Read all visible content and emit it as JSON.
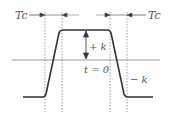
{
  "diagram": {
    "type": "trapezoidal-pulse",
    "colors": {
      "pulse": "#333333",
      "axis": "#999999",
      "dashed": "#888888",
      "arrow": "#444444",
      "text": "#555555"
    },
    "labels": {
      "tc_left": "Tc",
      "tc_right": "Tc",
      "plus_k": "+ k",
      "minus_k": "− k",
      "t_zero": "t = 0"
    }
  }
}
